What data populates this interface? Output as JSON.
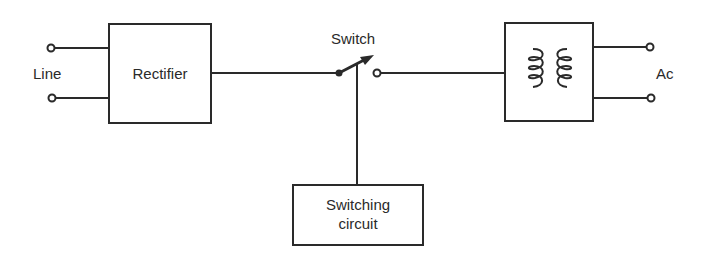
{
  "diagram": {
    "type": "block-diagram",
    "colors": {
      "stroke": "#2a2a2a",
      "background": "#ffffff"
    },
    "labels": {
      "input": "Line",
      "rectifier": "Rectifier",
      "switch": "Switch",
      "switching_circuit_line1": "Switching",
      "switching_circuit_line2": "circuit",
      "output": "Ac"
    },
    "blocks": [
      {
        "id": "rectifier",
        "label": "Rectifier"
      },
      {
        "id": "switch",
        "label": "Switch"
      },
      {
        "id": "transformer",
        "label": "",
        "icon": "transformer-icon"
      },
      {
        "id": "switching-circuit",
        "label": "Switching circuit"
      }
    ],
    "connections": [
      {
        "from": "Line",
        "to": "Rectifier"
      },
      {
        "from": "Rectifier",
        "to": "Switch"
      },
      {
        "from": "Switch",
        "to": "Transformer"
      },
      {
        "from": "Switching circuit",
        "to": "Switch"
      },
      {
        "from": "Transformer",
        "to": "Ac"
      }
    ]
  }
}
